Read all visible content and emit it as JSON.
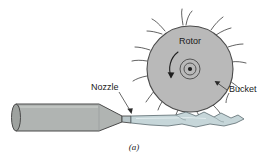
{
  "figure": {
    "title_caption": "(a)",
    "labels": {
      "rotor": "Rotor",
      "nozzle": "Nozzle",
      "bucket": "Bucket"
    },
    "colors": {
      "rotor_fill": "#b9b9b9",
      "rotor_stroke": "#4a4a4a",
      "pipe_fill": "#b0b4b2",
      "pipe_stroke": "#4a4a4a",
      "jet_fill": "#c6d6d9",
      "jet_stroke": "#5a6a6e",
      "background": "#ffffff",
      "text": "#1a1a1a"
    },
    "geometry": {
      "rotor_center_x": 190,
      "rotor_center_y": 69,
      "rotor_radius": 43,
      "hub_outer_radius": 10,
      "hub_inner_radius": 6,
      "hub_dot_radius": 2,
      "bucket_count": 11
    },
    "rotation_arrow": {
      "direction": "counterclockwise",
      "description": "curved arrow around hub"
    }
  }
}
